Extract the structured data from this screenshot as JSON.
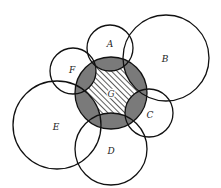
{
  "diagram": {
    "title": "",
    "colors": {
      "stroke": "#111111",
      "shade": "#7a7a7a",
      "hatch": "#333333",
      "background": "#ffffff"
    },
    "circles": [
      {
        "id": "A",
        "label": "A",
        "cx": 110,
        "cy": 48,
        "r": 23,
        "lx": 110,
        "ly": 47
      },
      {
        "id": "B",
        "label": "B",
        "cx": 166,
        "cy": 58,
        "r": 43,
        "lx": 165,
        "ly": 62
      },
      {
        "id": "C",
        "label": "C",
        "cx": 149,
        "cy": 113,
        "r": 24,
        "lx": 150,
        "ly": 118
      },
      {
        "id": "D",
        "label": "D",
        "cx": 111,
        "cy": 149,
        "r": 36,
        "lx": 111,
        "ly": 154
      },
      {
        "id": "E",
        "label": "E",
        "cx": 57,
        "cy": 125,
        "r": 44,
        "lx": 56,
        "ly": 130
      },
      {
        "id": "F",
        "label": "F",
        "cx": 73,
        "cy": 71,
        "r": 23,
        "lx": 72,
        "ly": 73
      },
      {
        "id": "G",
        "label": "G",
        "cx": 111,
        "cy": 93,
        "r": 36,
        "lx": 111,
        "ly": 97
      }
    ],
    "regions": {
      "shaded": "G intersected with union of A–F",
      "hatched": "G minus union of A–F"
    }
  }
}
